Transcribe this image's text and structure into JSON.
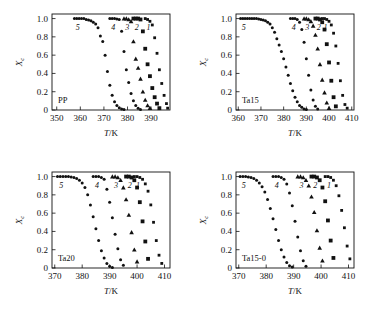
{
  "figure": {
    "title": "",
    "y_axis_label": "Xc",
    "x_axis_label": "T/K",
    "y_ticks": [
      "0",
      "0.2",
      "0.4",
      "0.6",
      "0.8",
      "1.0"
    ],
    "curve_numbers": [
      "5",
      "4",
      "3",
      "2",
      "1"
    ]
  },
  "chart_data": [
    {
      "type": "scatter",
      "panel": "a",
      "title": "PP",
      "xlabel": "T/K",
      "ylabel": "Xc",
      "xlim": [
        348,
        398
      ],
      "ylim": [
        0,
        1.05
      ],
      "xticks": [
        350,
        360,
        370,
        380,
        390
      ],
      "yticks": [
        0,
        0.2,
        0.4,
        0.6,
        0.8,
        1.0
      ],
      "grid": false,
      "legend": "inline-curve-numbers",
      "series": [
        {
          "name": "5",
          "marker": "circle",
          "x": [
            357.5,
            358.5,
            359.5,
            360.5,
            361.5,
            362.5,
            363.5,
            364.5,
            365.5,
            366.5,
            367.5,
            368.5,
            369.5,
            370.5,
            371.5,
            372.5,
            373.5,
            374.5,
            375.5,
            376.5,
            377.5,
            378.5
          ],
          "y": [
            1.0,
            1.0,
            1.0,
            1.0,
            1.0,
            0.99,
            0.985,
            0.975,
            0.96,
            0.94,
            0.9,
            0.81,
            0.75,
            0.6,
            0.42,
            0.27,
            0.16,
            0.09,
            0.05,
            0.025,
            0.01,
            0.005
          ]
        },
        {
          "name": "4",
          "marker": "circle",
          "x": [
            372.5,
            373.5,
            374.5,
            375.5,
            376.5,
            377.5,
            378.5,
            379.5,
            380.5,
            381.5,
            382.5,
            383.5,
            384.5,
            385.5
          ],
          "y": [
            1.0,
            1.0,
            1.0,
            0.995,
            0.99,
            0.86,
            0.64,
            0.44,
            0.3,
            0.18,
            0.1,
            0.05,
            0.02,
            0.005
          ]
        },
        {
          "name": "3",
          "marker": "triangle",
          "x": [
            378.5,
            379.5,
            380.5,
            381.5,
            382.5,
            383.5,
            384.5,
            385.5,
            386.5,
            387.5,
            388.5,
            389.5
          ],
          "y": [
            1.0,
            1.0,
            0.99,
            0.97,
            0.75,
            0.56,
            0.46,
            0.34,
            0.2,
            0.11,
            0.05,
            0.02
          ]
        },
        {
          "name": "2",
          "marker": "square",
          "x": [
            382.5,
            383.5,
            384.5,
            385.5,
            386.5,
            387.5,
            388.5,
            389.5,
            390.5,
            391.5,
            392.5,
            393.5
          ],
          "y": [
            1.0,
            1.0,
            1.0,
            0.99,
            0.86,
            0.67,
            0.5,
            0.37,
            0.24,
            0.14,
            0.07,
            0.02
          ]
        },
        {
          "name": "1",
          "marker": "square-small",
          "x": [
            387.5,
            388.5,
            389.5,
            390.5,
            391.5,
            392.5,
            393.5,
            394.5,
            395.5,
            396.5,
            397.0
          ],
          "y": [
            1.0,
            0.99,
            0.97,
            0.93,
            0.79,
            0.62,
            0.44,
            0.29,
            0.16,
            0.07,
            0.02
          ]
        }
      ]
    },
    {
      "type": "scatter",
      "panel": "b",
      "title": "Ta15",
      "xlabel": "T/K",
      "ylabel": "Xc",
      "xlim": [
        359,
        411
      ],
      "ylim": [
        0,
        1.05
      ],
      "xticks": [
        360,
        370,
        380,
        390,
        400,
        410
      ],
      "yticks": [
        0,
        0.2,
        0.4,
        0.6,
        0.8,
        1.0
      ],
      "grid": false,
      "legend": "inline-curve-numbers",
      "series": [
        {
          "name": "5",
          "marker": "circle",
          "x": [
            361,
            362,
            363,
            364,
            365,
            366,
            367,
            368,
            369,
            370,
            371,
            372,
            373,
            374,
            375,
            376,
            377,
            378,
            379,
            380,
            381,
            382,
            383,
            384,
            385,
            386,
            387,
            388,
            389,
            390
          ],
          "y": [
            1.0,
            1.0,
            1.0,
            1.0,
            1.0,
            1.0,
            1.0,
            1.0,
            0.995,
            0.99,
            0.985,
            0.975,
            0.96,
            0.94,
            0.9,
            0.85,
            0.78,
            0.71,
            0.64,
            0.56,
            0.47,
            0.38,
            0.29,
            0.21,
            0.14,
            0.09,
            0.05,
            0.03,
            0.01,
            0.005
          ]
        },
        {
          "name": "4",
          "marker": "circle",
          "x": [
            383,
            384,
            385,
            386,
            387,
            388,
            389,
            390,
            391,
            392,
            393,
            394,
            395
          ],
          "y": [
            1.0,
            1.0,
            1.0,
            0.99,
            0.96,
            0.88,
            0.74,
            0.56,
            0.38,
            0.22,
            0.11,
            0.04,
            0.01
          ]
        },
        {
          "name": "3",
          "marker": "triangle",
          "x": [
            389,
            390,
            391,
            392,
            393,
            394,
            395,
            396,
            397,
            398,
            399,
            400
          ],
          "y": [
            1.0,
            1.0,
            0.99,
            0.97,
            0.92,
            0.82,
            0.67,
            0.5,
            0.33,
            0.19,
            0.08,
            0.02
          ]
        },
        {
          "name": "2",
          "marker": "square",
          "x": [
            394,
            395,
            396,
            397,
            398,
            399,
            400,
            401,
            402,
            403
          ],
          "y": [
            1.0,
            1.0,
            0.99,
            0.96,
            0.88,
            0.72,
            0.52,
            0.32,
            0.14,
            0.04
          ]
        },
        {
          "name": "1",
          "marker": "square-small",
          "x": [
            397,
            398,
            399,
            400,
            401,
            402,
            403,
            404,
            405,
            406,
            407,
            408
          ],
          "y": [
            1.0,
            1.0,
            0.99,
            0.97,
            0.93,
            0.84,
            0.7,
            0.51,
            0.32,
            0.16,
            0.06,
            0.02
          ]
        }
      ]
    },
    {
      "type": "scatter",
      "panel": "c",
      "title": "Ta20",
      "xlabel": "T/K",
      "ylabel": "Xc",
      "xlim": [
        369,
        412
      ],
      "ylim": [
        0,
        1.05
      ],
      "xticks": [
        370,
        380,
        390,
        400,
        410
      ],
      "yticks": [
        0,
        0.2,
        0.4,
        0.6,
        0.8,
        1.0
      ],
      "grid": false,
      "legend": "inline-curve-numbers",
      "series": [
        {
          "name": "5",
          "marker": "circle",
          "x": [
            371,
            372,
            373,
            374,
            375,
            376,
            377,
            378,
            379,
            380,
            381,
            382,
            383,
            384,
            385,
            386,
            387,
            388,
            389,
            390,
            391
          ],
          "y": [
            1.0,
            1.0,
            1.0,
            1.0,
            1.0,
            0.995,
            0.99,
            0.98,
            0.96,
            0.93,
            0.88,
            0.8,
            0.69,
            0.56,
            0.43,
            0.3,
            0.19,
            0.11,
            0.05,
            0.02,
            0.005
          ]
        },
        {
          "name": "4",
          "marker": "circle",
          "x": [
            384,
            385,
            386,
            387,
            388,
            389,
            390,
            391,
            392,
            393,
            394,
            395
          ],
          "y": [
            1.0,
            1.0,
            1.0,
            0.99,
            0.97,
            0.86,
            0.72,
            0.55,
            0.37,
            0.21,
            0.09,
            0.03
          ]
        },
        {
          "name": "3",
          "marker": "triangle",
          "x": [
            391,
            392,
            393,
            394,
            395,
            396,
            397,
            398,
            399,
            400
          ],
          "y": [
            1.0,
            1.0,
            0.99,
            0.96,
            0.88,
            0.75,
            0.58,
            0.39,
            0.2,
            0.07
          ]
        },
        {
          "name": "2",
          "marker": "square",
          "x": [
            396,
            397,
            398,
            399,
            400,
            401,
            402,
            403,
            404
          ],
          "y": [
            1.0,
            1.0,
            0.99,
            0.96,
            0.88,
            0.72,
            0.51,
            0.29,
            0.1
          ]
        },
        {
          "name": "1",
          "marker": "square-small",
          "x": [
            399,
            400,
            401,
            402,
            403,
            404,
            405,
            406,
            407,
            408,
            409
          ],
          "y": [
            1.0,
            1.0,
            0.99,
            0.97,
            0.92,
            0.84,
            0.69,
            0.5,
            0.3,
            0.14,
            0.05
          ]
        }
      ]
    },
    {
      "type": "scatter",
      "panel": "d",
      "title": "Ta15-0",
      "xlabel": "T/K",
      "ylabel": "Xc",
      "xlim": [
        369,
        412
      ],
      "ylim": [
        0,
        1.05
      ],
      "xticks": [
        370,
        380,
        390,
        400,
        410
      ],
      "yticks": [
        0,
        0.2,
        0.4,
        0.6,
        0.8,
        1.0
      ],
      "grid": false,
      "legend": "inline-curve-numbers",
      "series": [
        {
          "name": "5",
          "marker": "circle",
          "x": [
            370.5,
            371.5,
            372.5,
            373.5,
            374.5,
            375.5,
            376.5,
            377.5,
            378.5,
            379.5,
            380.5,
            381.5,
            382.5,
            383.5,
            384.5,
            385.5,
            386.5,
            387.5,
            388.5,
            389.5
          ],
          "y": [
            1.0,
            1.0,
            1.0,
            0.995,
            0.99,
            0.98,
            0.96,
            0.93,
            0.89,
            0.83,
            0.75,
            0.65,
            0.54,
            0.42,
            0.3,
            0.2,
            0.12,
            0.06,
            0.025,
            0.01
          ]
        },
        {
          "name": "4",
          "marker": "circle",
          "x": [
            382.5,
            383.5,
            384.5,
            385.5,
            386.5,
            387.5,
            388.5,
            389.5,
            390.5,
            391.5,
            392.5,
            393.5,
            394.5
          ],
          "y": [
            1.0,
            1.0,
            1.0,
            0.99,
            0.97,
            0.92,
            0.82,
            0.68,
            0.51,
            0.34,
            0.19,
            0.08,
            0.02
          ]
        },
        {
          "name": "3",
          "marker": "triangle",
          "x": [
            391.5,
            392.5,
            393.5,
            394.5,
            395.5,
            396.5,
            397.5,
            398.5,
            399.5,
            400.5
          ],
          "y": [
            1.0,
            1.0,
            0.99,
            0.96,
            0.9,
            0.78,
            0.61,
            0.41,
            0.22,
            0.08
          ]
        },
        {
          "name": "2",
          "marker": "square",
          "x": [
            396.5,
            397.5,
            398.5,
            399.5,
            400.5,
            401.5,
            402.5,
            403.5,
            404.5
          ],
          "y": [
            1.0,
            1.0,
            0.99,
            0.96,
            0.88,
            0.73,
            0.52,
            0.3,
            0.11
          ]
        },
        {
          "name": "1",
          "marker": "square-small",
          "x": [
            401.5,
            402.5,
            403.5,
            404.5,
            405.5,
            406.5,
            407.5,
            408.5,
            409.5,
            410.5
          ],
          "y": [
            1.0,
            1.0,
            0.99,
            0.96,
            0.9,
            0.79,
            0.63,
            0.44,
            0.24,
            0.1
          ]
        }
      ]
    }
  ]
}
